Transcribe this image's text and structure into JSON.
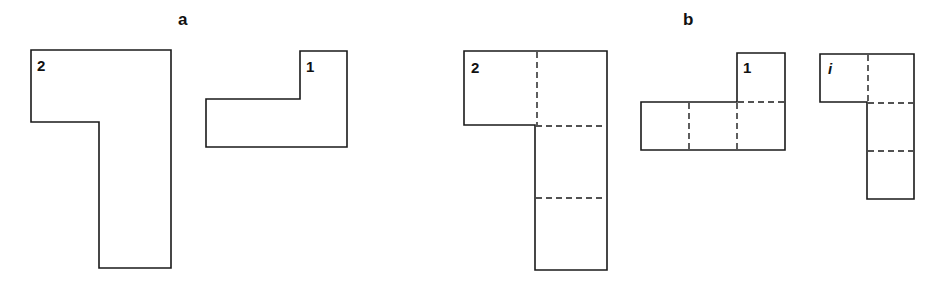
{
  "panels": [
    {
      "label": "a",
      "shapes": [
        {
          "label": "2",
          "kind": "L-shape, undivided"
        },
        {
          "label": "1",
          "kind": "L-shape, undivided"
        }
      ]
    },
    {
      "label": "b",
      "shapes": [
        {
          "label": "2",
          "kind": "L-shape divided into 4 unit squares (dashed)"
        },
        {
          "label": "1",
          "kind": "L-shape divided into 4 unit squares (dashed)"
        },
        {
          "label": "i",
          "kind": "L-shape divided into 4 unit squares (dashed)"
        }
      ]
    }
  ],
  "colors": {
    "stroke": "#1a1a1a",
    "background": "#ffffff"
  }
}
